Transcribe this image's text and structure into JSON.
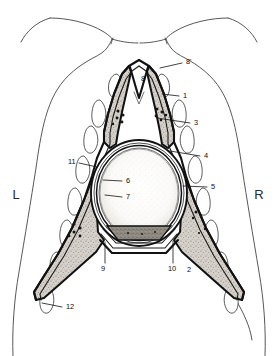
{
  "figure": {
    "orientation_markers": [
      {
        "id": "left-marker",
        "text": "L",
        "x": 16,
        "y": 196
      },
      {
        "id": "right-marker",
        "text": "R",
        "x": 259,
        "y": 196
      }
    ],
    "callouts": [
      {
        "id": "callout-8p",
        "text": "8'",
        "tx": 186,
        "ty": 62,
        "lx1": 182,
        "ly1": 63,
        "lx2": 160,
        "ly2": 68
      },
      {
        "id": "callout-8",
        "text": "8",
        "tx": 141,
        "ty": 79,
        "lx1": 0,
        "ly1": 0,
        "lx2": 0,
        "ly2": 0
      },
      {
        "id": "callout-1",
        "text": "1",
        "tx": 183,
        "ty": 96,
        "lx1": 179,
        "ly1": 96,
        "lx2": 162,
        "ly2": 94
      },
      {
        "id": "callout-3",
        "text": "3",
        "tx": 194,
        "ty": 123,
        "lx1": 190,
        "ly1": 123,
        "lx2": 157,
        "ly2": 118
      },
      {
        "id": "callout-4",
        "text": "4",
        "tx": 204,
        "ty": 156,
        "lx1": 200,
        "ly1": 156,
        "lx2": 170,
        "ly2": 151
      },
      {
        "id": "callout-5",
        "text": "5",
        "tx": 211,
        "ty": 187,
        "lx1": 207,
        "ly1": 187,
        "lx2": 183,
        "ly2": 186
      },
      {
        "id": "callout-6",
        "text": "6",
        "tx": 126,
        "ty": 181,
        "lx1": 122,
        "ly1": 181,
        "lx2": 103,
        "ly2": 180
      },
      {
        "id": "callout-7",
        "text": "7",
        "tx": 126,
        "ty": 197,
        "lx1": 122,
        "ly1": 197,
        "lx2": 105,
        "ly2": 195
      },
      {
        "id": "callout-11",
        "text": "11",
        "tx": 70,
        "ty": 162,
        "lx1": 79,
        "ly1": 163,
        "lx2": 97,
        "ly2": 167
      },
      {
        "id": "callout-9",
        "text": "9",
        "tx": 103,
        "ty": 268,
        "lx1": 105,
        "ly1": 263,
        "lx2": 105,
        "ly2": 242
      },
      {
        "id": "callout-10",
        "text": "10",
        "tx": 170,
        "ty": 268,
        "lx1": 173,
        "ly1": 263,
        "lx2": 173,
        "ly2": 241
      },
      {
        "id": "callout-2",
        "text": "2",
        "tx": 187,
        "ty": 270,
        "lx1": 0,
        "ly1": 0,
        "lx2": 0,
        "ly2": 0
      },
      {
        "id": "callout-12",
        "text": "12",
        "tx": 66,
        "ty": 307,
        "lx1": 62,
        "ly1": 307,
        "lx2": 42,
        "ly2": 303
      }
    ]
  },
  "palette": {
    "background": "#ffffff",
    "body_outline": "#585858",
    "heavy_line": "#111111",
    "wedge_fill": "#cfc9c2",
    "core_fill": "#f7f5f1",
    "vertebra_fill": "#8c8880",
    "label_color": "#0d0d0d"
  }
}
